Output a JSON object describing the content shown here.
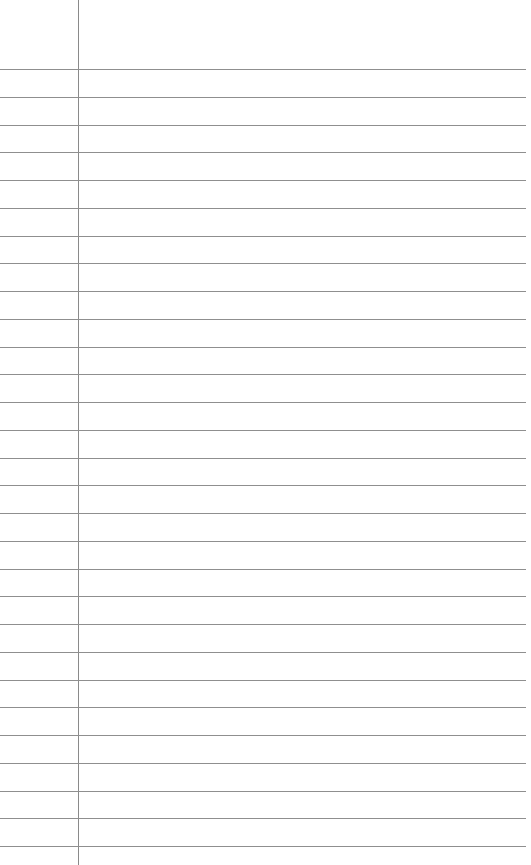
{
  "page": {
    "kind": "lined-notebook-paper",
    "width": 531,
    "height": 865,
    "background_color": "#ffffff",
    "content_text": "",
    "has_text": false
  },
  "margin_rule": {
    "name": "vertical-margin-line",
    "x": 78,
    "y_start": 0,
    "y_end": 865,
    "thickness": 1,
    "color": "#8a8a8a"
  },
  "ruled_lines": {
    "count": 29,
    "first_y": 69,
    "spacing": 27.75,
    "x_start": 0,
    "x_end": 526,
    "thickness": 1,
    "color": "#8f8f8f",
    "positions": [
      69,
      96.8,
      124.5,
      152.3,
      180,
      207.8,
      235.5,
      263.3,
      291,
      318.8,
      346.5,
      374.3,
      402,
      429.8,
      457.5,
      485.3,
      513,
      540.8,
      568.5,
      596.3,
      624,
      651.8,
      679.5,
      707.3,
      735,
      762.8,
      790.5,
      818.3,
      846
    ]
  },
  "regions": {
    "header_label": "",
    "margin_label": "",
    "body_label": ""
  }
}
